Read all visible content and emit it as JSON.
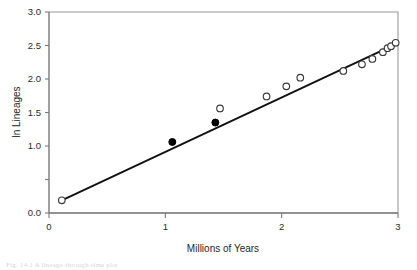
{
  "figure": {
    "background_color": "#ffffff",
    "line_color": "#111111",
    "marker_open_color": "#ffffff",
    "marker_edge_color": "#3a3a3a",
    "marker_filled_color": "#000000",
    "axis_color": "#6e6e6e",
    "caption_partial": "Fig. 14.1  A lineage-through-time plot"
  },
  "chart_data": {
    "type": "scatter",
    "title": "",
    "xlabel": "Millions of Years",
    "ylabel": "ln Lineages",
    "xlim": [
      0,
      3
    ],
    "ylim": [
      0.0,
      3.0
    ],
    "grid": false,
    "legend": "none",
    "xticks": [
      0,
      1,
      2,
      3
    ],
    "xticklabels": [
      "0",
      "1",
      "2",
      "3"
    ],
    "yticks": [
      0.0,
      0.5,
      1.0,
      1.5,
      2.0,
      2.5,
      3.0
    ],
    "yticklabels": [
      "0.0",
      "",
      "1.0",
      "1.5",
      "2.0",
      "2.5",
      "3.0"
    ],
    "series": [
      {
        "name": "open circles",
        "marker": "open-circle",
        "points": [
          [
            0.11,
            0.19
          ],
          [
            1.47,
            1.56
          ],
          [
            1.87,
            1.74
          ],
          [
            2.04,
            1.89
          ],
          [
            2.16,
            2.02
          ],
          [
            2.53,
            2.12
          ],
          [
            2.69,
            2.22
          ],
          [
            2.78,
            2.3
          ],
          [
            2.87,
            2.4
          ],
          [
            2.91,
            2.46
          ],
          [
            2.94,
            2.49
          ],
          [
            2.98,
            2.54
          ]
        ]
      },
      {
        "name": "filled circles",
        "marker": "filled-circle",
        "points": [
          [
            1.06,
            1.06
          ],
          [
            1.43,
            1.35
          ]
        ]
      },
      {
        "name": "regression line",
        "marker": "line",
        "points": [
          [
            0.11,
            0.19
          ],
          [
            2.98,
            2.52
          ]
        ]
      }
    ]
  }
}
